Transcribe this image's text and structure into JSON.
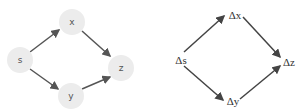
{
  "left_diagram": {
    "nodes": [
      {
        "id": "s",
        "label": "s",
        "cx": 20,
        "cy": 60
      },
      {
        "id": "x",
        "label": "x",
        "cx": 72,
        "cy": 22
      },
      {
        "id": "z",
        "label": "z",
        "cx": 121,
        "cy": 68
      },
      {
        "id": "y",
        "label": "y",
        "cx": 71,
        "cy": 96
      }
    ],
    "edges": [
      [
        "s",
        "x"
      ],
      [
        "s",
        "y"
      ],
      [
        "x",
        "z"
      ],
      [
        "y",
        "z"
      ]
    ],
    "node_fill": "#ececec",
    "edge_color": "#555555"
  },
  "right_diagram": {
    "nodes": [
      {
        "id": "ds",
        "label": "Δs",
        "x": 181,
        "y": 60
      },
      {
        "id": "dx",
        "label": "Δx",
        "x": 234,
        "y": 16
      },
      {
        "id": "dz",
        "label": "Δz",
        "x": 284,
        "y": 63
      },
      {
        "id": "dy",
        "label": "Δy",
        "x": 232,
        "y": 101
      }
    ],
    "edges": [
      [
        "ds",
        "dx"
      ],
      [
        "ds",
        "dy"
      ],
      [
        "dx",
        "dz"
      ],
      [
        "dy",
        "dz"
      ]
    ],
    "edge_color": "#444444"
  }
}
